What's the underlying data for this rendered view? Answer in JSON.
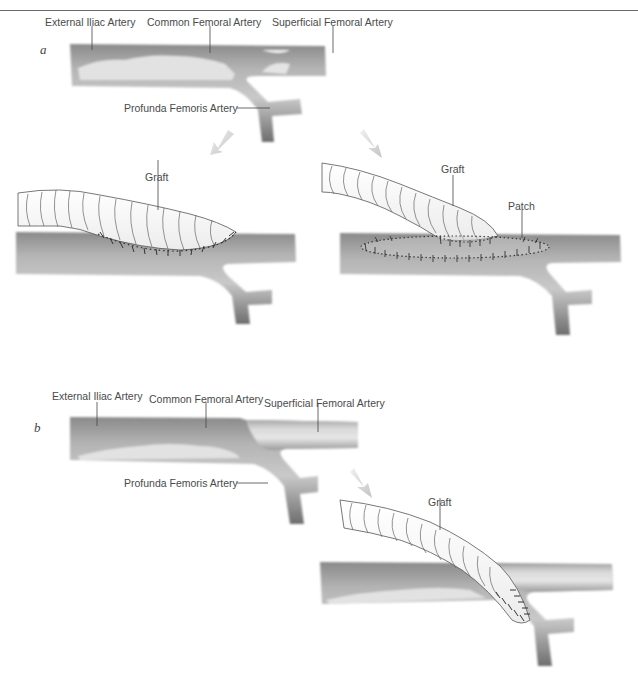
{
  "figure": {
    "panels": [
      {
        "letter": "a",
        "labels": {
          "external_iliac": "External Iliac Artery",
          "common_femoral": "Common Femoral Artery",
          "superficial_femoral": "Superficial Femoral Artery",
          "profunda_femoris": "Profunda Femoris Artery"
        },
        "subpanels": [
          {
            "labels": {
              "graft": "Graft"
            }
          },
          {
            "labels": {
              "graft": "Graft",
              "patch": "Patch"
            }
          }
        ]
      },
      {
        "letter": "b",
        "labels": {
          "external_iliac": "External Iliac Artery",
          "common_femoral": "Common Femoral Artery",
          "superficial_femoral": "Superficial Femoral Artery",
          "profunda_femoris": "Profunda Femoris Artery"
        },
        "subpanels": [
          {
            "labels": {
              "graft": "Graft"
            }
          }
        ]
      }
    ],
    "colors": {
      "vessel_dark": "#7a7a7a",
      "vessel_mid": "#a8a8a8",
      "vessel_light": "#d4d4d4",
      "plaque": "#e4e4e4",
      "graft_fill": "#ffffff",
      "graft_line": "#555555",
      "suture": "#333333",
      "arrow": "#cfcfcf"
    }
  }
}
